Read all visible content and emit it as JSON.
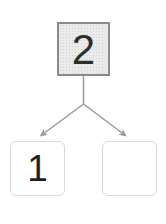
{
  "diagram": {
    "kind": "number-bond",
    "whole": "2",
    "parts": [
      "1",
      ""
    ],
    "colors": {
      "connector": "#999999",
      "whole_box_border": "#8a8a8a",
      "whole_box_fill": "#ebebeb",
      "part_box_border": "#d8d8d8",
      "digit": "#2e2e2e",
      "background": "#ffffff"
    }
  }
}
